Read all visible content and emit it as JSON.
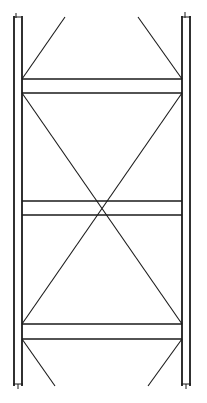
{
  "diagram": {
    "title": "",
    "colors": {
      "background": "#ffffff",
      "stroke": "#1a1a1a"
    },
    "posts": [
      {
        "name": "left-outer-post",
        "x": 14,
        "y1": 16,
        "y2": 386
      },
      {
        "name": "left-inner-post",
        "x": 22,
        "y1": 16,
        "y2": 386
      },
      {
        "name": "right-inner-post",
        "x": 182,
        "y1": 16,
        "y2": 386
      },
      {
        "name": "right-outer-post",
        "x": 190,
        "y1": 16,
        "y2": 386
      }
    ],
    "struts": [
      {
        "name": "top-strut-upper",
        "y": 79
      },
      {
        "name": "top-strut-lower",
        "y": 93
      },
      {
        "name": "middle-strut-upper",
        "y": 201
      },
      {
        "name": "middle-strut-lower",
        "y": 215
      },
      {
        "name": "bottom-strut-upper",
        "y": 324
      },
      {
        "name": "bottom-strut-lower",
        "y": 339
      }
    ],
    "braces": [
      {
        "name": "top-left-knee-brace",
        "x1": 22,
        "y1": 79,
        "x2": 65,
        "y2": 17
      },
      {
        "name": "top-right-knee-brace",
        "x1": 182,
        "y1": 79,
        "x2": 138,
        "y2": 17
      },
      {
        "name": "cross-brace-a",
        "x1": 22,
        "y1": 93,
        "x2": 182,
        "y2": 324
      },
      {
        "name": "cross-brace-b",
        "x1": 182,
        "y1": 93,
        "x2": 22,
        "y2": 324
      },
      {
        "name": "bottom-left-knee-brace",
        "x1": 22,
        "y1": 339,
        "x2": 55,
        "y2": 386
      },
      {
        "name": "bottom-right-knee-brace",
        "x1": 182,
        "y1": 339,
        "x2": 148,
        "y2": 386
      }
    ]
  }
}
